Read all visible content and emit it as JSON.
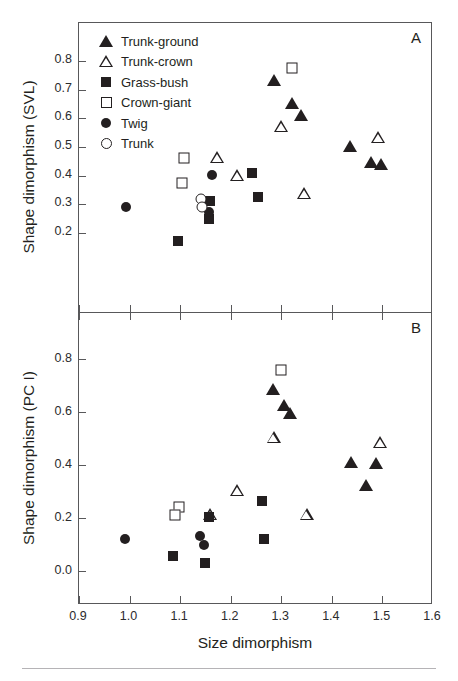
{
  "page": {
    "folio": "",
    "running_head": ""
  },
  "figure": {
    "panel_a_letter": "A",
    "panel_b_letter": "B",
    "xlabel": "Size dimorphism",
    "ylabel_a": "Shape dimorphism (SVL)",
    "ylabel_b": "Shape dimorphism (PC I)",
    "legend": [
      {
        "label": "Trunk-ground",
        "symbol": "filled-triangle"
      },
      {
        "label": "Trunk-crown",
        "symbol": "open-triangle"
      },
      {
        "label": "Grass-bush",
        "symbol": "filled-square"
      },
      {
        "label": "Crown-giant",
        "symbol": "open-square"
      },
      {
        "label": "Twig",
        "symbol": "filled-circle"
      },
      {
        "label": "Trunk",
        "symbol": "open-circle"
      }
    ],
    "marker_color": "#231f20",
    "axis_color": "#58585a"
  },
  "chart_data": [
    {
      "type": "scatter",
      "panel": "A",
      "title": "",
      "xlabel": "Size dimorphism",
      "ylabel": "Shape dimorphism (SVL)",
      "xlim": [
        0.9,
        1.6
      ],
      "ylim": [
        0.13,
        0.86
      ],
      "xticks": [
        0.9,
        1.0,
        1.1,
        1.2,
        1.3,
        1.4,
        1.5,
        1.6
      ],
      "yticks": [
        0.2,
        0.3,
        0.4,
        0.5,
        0.6,
        0.7,
        0.8
      ],
      "grid": false,
      "legend_position": "top-left inside",
      "series": [
        {
          "name": "Trunk-ground",
          "symbol": "filled-triangle",
          "points": [
            [
              1.285,
              0.732
            ],
            [
              1.322,
              0.652
            ],
            [
              1.338,
              0.613
            ],
            [
              1.435,
              0.502
            ],
            [
              1.478,
              0.447
            ],
            [
              1.497,
              0.44
            ]
          ]
        },
        {
          "name": "Trunk-crown",
          "symbol": "open-triangle",
          "points": [
            [
              1.173,
              0.465
            ],
            [
              1.213,
              0.404
            ],
            [
              1.3,
              0.572
            ],
            [
              1.345,
              0.34
            ],
            [
              1.492,
              0.535
            ]
          ]
        },
        {
          "name": "Grass-bush",
          "symbol": "filled-square",
          "points": [
            [
              1.096,
              0.172
            ],
            [
              1.16,
              0.31
            ],
            [
              1.158,
              0.248
            ],
            [
              1.243,
              0.411
            ],
            [
              1.253,
              0.325
            ]
          ]
        },
        {
          "name": "Crown-giant",
          "symbol": "open-square",
          "points": [
            [
              1.108,
              0.46
            ],
            [
              1.104,
              0.374
            ],
            [
              1.322,
              0.775
            ]
          ]
        },
        {
          "name": "Twig",
          "symbol": "filled-circle",
          "points": [
            [
              0.993,
              0.291
            ],
            [
              1.163,
              0.402
            ],
            [
              1.158,
              0.273
            ]
          ]
        },
        {
          "name": "Trunk",
          "symbol": "open-circle",
          "points": [
            [
              1.142,
              0.317
            ],
            [
              1.143,
              0.29
            ]
          ]
        }
      ]
    },
    {
      "type": "scatter",
      "panel": "B",
      "title": "",
      "xlabel": "Size dimorphism",
      "ylabel": "Shape dimorphism (PC I)",
      "xlim": [
        0.9,
        1.6
      ],
      "ylim": [
        -0.06,
        0.88
      ],
      "xticks": [
        0.9,
        1.0,
        1.1,
        1.2,
        1.3,
        1.4,
        1.5,
        1.6
      ],
      "yticks": [
        0.0,
        0.2,
        0.4,
        0.6,
        0.8
      ],
      "grid": false,
      "legend_position": "none",
      "series": [
        {
          "name": "Trunk-ground",
          "symbol": "filled-triangle",
          "points": [
            [
              1.283,
              0.685
            ],
            [
              1.305,
              0.625
            ],
            [
              1.318,
              0.595
            ],
            [
              1.438,
              0.41
            ],
            [
              1.468,
              0.325
            ],
            [
              1.488,
              0.408
            ]
          ]
        },
        {
          "name": "Trunk-crown",
          "symbol": "open-triangle",
          "points": [
            [
              1.16,
              0.215
            ],
            [
              1.213,
              0.305
            ],
            [
              1.285,
              0.505
            ],
            [
              1.35,
              0.215
            ],
            [
              1.495,
              0.487
            ]
          ]
        },
        {
          "name": "Grass-bush",
          "symbol": "filled-square",
          "points": [
            [
              1.085,
              0.058
            ],
            [
              1.158,
              0.205
            ],
            [
              1.15,
              0.032
            ],
            [
              1.262,
              0.265
            ],
            [
              1.265,
              0.122
            ]
          ]
        },
        {
          "name": "Crown-giant",
          "symbol": "open-square",
          "points": [
            [
              1.097,
              0.24
            ],
            [
              1.09,
              0.213
            ],
            [
              1.3,
              0.76
            ]
          ]
        },
        {
          "name": "Twig",
          "symbol": "filled-circle",
          "points": [
            [
              0.99,
              0.122
            ],
            [
              1.14,
              0.132
            ],
            [
              1.148,
              0.1
            ]
          ]
        },
        {
          "name": "Trunk",
          "symbol": "open-circle",
          "points": []
        }
      ]
    }
  ]
}
